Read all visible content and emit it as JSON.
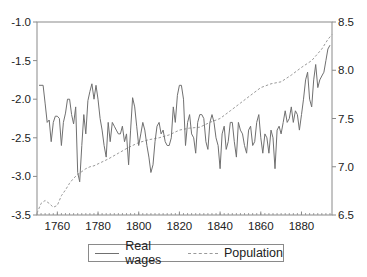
{
  "chart_data": {
    "type": "line",
    "title": "",
    "xlabel": "",
    "ylabel_left": "",
    "ylabel_right": "",
    "x_range": [
      1750,
      1895
    ],
    "x_ticks": [
      1760,
      1780,
      1800,
      1820,
      1840,
      1860,
      1880
    ],
    "y_left": {
      "range": [
        -3.5,
        -1.0
      ],
      "ticks": [
        "-1.0",
        "-1.5",
        "-2.0",
        "-2.5",
        "-3.0",
        "-3.5"
      ]
    },
    "y_right": {
      "range": [
        6.5,
        8.5
      ],
      "ticks": [
        "8.5",
        "8.0",
        "7.5",
        "7.0",
        "6.5"
      ]
    },
    "grid": false,
    "legend_position": "bottom",
    "series": [
      {
        "name": "Real wages",
        "axis": "left",
        "style": "solid",
        "color": "#707070",
        "x": [
          1751,
          1753,
          1754,
          1755,
          1756,
          1757,
          1758,
          1759,
          1760,
          1761,
          1762,
          1763,
          1764,
          1765,
          1766,
          1767,
          1768,
          1769,
          1770,
          1771,
          1772,
          1773,
          1774,
          1775,
          1776,
          1777,
          1778,
          1779,
          1780,
          1781,
          1782,
          1783,
          1784,
          1785,
          1786,
          1787,
          1788,
          1789,
          1790,
          1791,
          1792,
          1793,
          1794,
          1795,
          1796,
          1797,
          1798,
          1799,
          1800,
          1801,
          1802,
          1803,
          1804,
          1805,
          1806,
          1807,
          1808,
          1809,
          1810,
          1811,
          1812,
          1813,
          1814,
          1815,
          1816,
          1817,
          1818,
          1819,
          1820,
          1821,
          1822,
          1823,
          1824,
          1825,
          1826,
          1827,
          1828,
          1829,
          1830,
          1831,
          1832,
          1833,
          1834,
          1835,
          1836,
          1837,
          1838,
          1839,
          1840,
          1841,
          1842,
          1843,
          1844,
          1845,
          1846,
          1847,
          1848,
          1849,
          1850,
          1851,
          1852,
          1853,
          1854,
          1855,
          1856,
          1857,
          1858,
          1859,
          1860,
          1861,
          1862,
          1863,
          1864,
          1865,
          1866,
          1867,
          1868,
          1869,
          1870,
          1871,
          1872,
          1873,
          1874,
          1875,
          1876,
          1877,
          1878,
          1879,
          1880,
          1881,
          1882,
          1883,
          1884,
          1885,
          1886,
          1887,
          1888,
          1889,
          1890,
          1891,
          1892,
          1893,
          1894
        ],
        "values": [
          -1.82,
          -1.82,
          -2.05,
          -2.3,
          -2.27,
          -2.55,
          -2.3,
          -2.22,
          -2.22,
          -2.25,
          -2.6,
          -2.3,
          -2.18,
          -2.0,
          -2.0,
          -2.2,
          -2.32,
          -2.1,
          -2.95,
          -3.07,
          -2.6,
          -2.2,
          -2.45,
          -2.02,
          -1.9,
          -1.8,
          -2.0,
          -1.82,
          -2.0,
          -2.25,
          -2.4,
          -2.6,
          -2.75,
          -2.3,
          -2.55,
          -2.3,
          -2.35,
          -2.4,
          -2.45,
          -2.45,
          -2.35,
          -2.55,
          -2.45,
          -2.85,
          -2.4,
          -1.98,
          -2.1,
          -2.35,
          -2.6,
          -2.45,
          -2.3,
          -2.4,
          -2.6,
          -2.75,
          -2.95,
          -2.85,
          -2.55,
          -2.35,
          -2.3,
          -2.45,
          -2.4,
          -2.55,
          -2.6,
          -2.6,
          -2.5,
          -2.1,
          -2.3,
          -1.95,
          -1.82,
          -1.82,
          -2.0,
          -2.6,
          -2.3,
          -2.2,
          -2.45,
          -2.5,
          -2.7,
          -2.3,
          -2.2,
          -2.2,
          -2.25,
          -2.55,
          -2.65,
          -2.3,
          -2.2,
          -2.3,
          -2.5,
          -2.6,
          -2.9,
          -2.45,
          -2.35,
          -2.65,
          -2.55,
          -2.3,
          -2.3,
          -2.55,
          -2.75,
          -2.3,
          -2.4,
          -2.45,
          -2.6,
          -2.7,
          -2.4,
          -2.35,
          -2.6,
          -2.55,
          -2.3,
          -2.2,
          -2.5,
          -2.7,
          -2.45,
          -2.5,
          -2.7,
          -2.4,
          -2.5,
          -2.9,
          -2.4,
          -2.35,
          -2.45,
          -2.3,
          -2.15,
          -2.3,
          -2.25,
          -2.1,
          -2.3,
          -2.15,
          -2.2,
          -2.4,
          -2.2,
          -2.0,
          -1.75,
          -1.65,
          -2.0,
          -2.1,
          -1.75,
          -1.55,
          -1.85,
          -1.75,
          -1.7,
          -1.65,
          -1.5,
          -1.35,
          -1.3
        ],
        "note": "approximate readings"
      },
      {
        "name": "Population",
        "axis": "right",
        "style": "dashed",
        "color": "#9a9a9a",
        "x": [
          1750,
          1752,
          1754,
          1756,
          1758,
          1760,
          1762,
          1764,
          1766,
          1768,
          1770,
          1772,
          1774,
          1776,
          1778,
          1780,
          1785,
          1790,
          1795,
          1800,
          1805,
          1810,
          1815,
          1820,
          1825,
          1830,
          1835,
          1840,
          1845,
          1850,
          1855,
          1860,
          1865,
          1870,
          1875,
          1880,
          1885,
          1890,
          1893,
          1895
        ],
        "values": [
          6.52,
          6.62,
          6.65,
          6.62,
          6.58,
          6.6,
          6.7,
          6.76,
          6.83,
          6.88,
          6.92,
          6.95,
          6.98,
          7.0,
          7.01,
          7.03,
          7.08,
          7.14,
          7.2,
          7.25,
          7.28,
          7.3,
          7.33,
          7.38,
          7.4,
          7.41,
          7.46,
          7.5,
          7.58,
          7.66,
          7.74,
          7.82,
          7.86,
          7.88,
          7.95,
          8.03,
          8.1,
          8.22,
          8.32,
          8.37
        ]
      }
    ]
  },
  "legend": {
    "items": [
      {
        "label": "Real wages",
        "style": "solid"
      },
      {
        "label": "Population",
        "style": "dashed"
      }
    ]
  }
}
